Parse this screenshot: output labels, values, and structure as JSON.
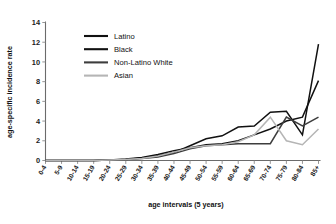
{
  "chart_data": {
    "type": "line",
    "title": "",
    "xlabel": "age intervals (5 years)",
    "ylabel": "age-specific incidence rate",
    "categories": [
      "0-4",
      "5-9",
      "10-14",
      "15-19",
      "20-24",
      "25-29",
      "30-34",
      "35-39",
      "40-44",
      "45-49",
      "50-54",
      "55-59",
      "60-64",
      "65-69",
      "70-74",
      "75-79",
      "80-84",
      "85+"
    ],
    "ylim": [
      0,
      14
    ],
    "yticks": [
      0,
      2,
      4,
      6,
      8,
      10,
      12,
      14
    ],
    "grid": false,
    "legend_position": "upper-left-inside",
    "series": [
      {
        "name": "Latino",
        "color": "#111111",
        "width": 1.5,
        "values": [
          0,
          0,
          0,
          0,
          0.05,
          0.1,
          0.25,
          0.5,
          0.8,
          1.5,
          2.2,
          2.5,
          3.4,
          3.5,
          4.9,
          5.0,
          2.6,
          11.8
        ]
      },
      {
        "name": "Black",
        "color": "#111111",
        "width": 1.5,
        "values": [
          0,
          0,
          0,
          0,
          0.05,
          0.15,
          0.3,
          0.6,
          1.0,
          1.3,
          1.6,
          1.7,
          2.0,
          2.6,
          3.2,
          4.0,
          4.4,
          8.1
        ]
      },
      {
        "name": "Non-Latino White",
        "color": "#3d3d3d",
        "width": 1.5,
        "values": [
          0,
          0,
          0,
          0,
          0.05,
          0.1,
          0.2,
          0.35,
          0.7,
          1.2,
          1.5,
          1.6,
          1.7,
          1.7,
          1.7,
          4.4,
          3.5,
          4.4
        ]
      },
      {
        "name": "Asian",
        "color": "#b5b5b5",
        "width": 1.5,
        "values": [
          0,
          0,
          0,
          0,
          0.05,
          0.1,
          0.2,
          0.45,
          0.85,
          1.3,
          1.5,
          1.6,
          1.9,
          2.6,
          4.4,
          2.0,
          1.6,
          3.2
        ]
      }
    ]
  },
  "legend": {
    "entries": [
      {
        "label": "Latino"
      },
      {
        "label": "Black"
      },
      {
        "label": "Non-Latino White"
      },
      {
        "label": "Asian"
      }
    ]
  }
}
